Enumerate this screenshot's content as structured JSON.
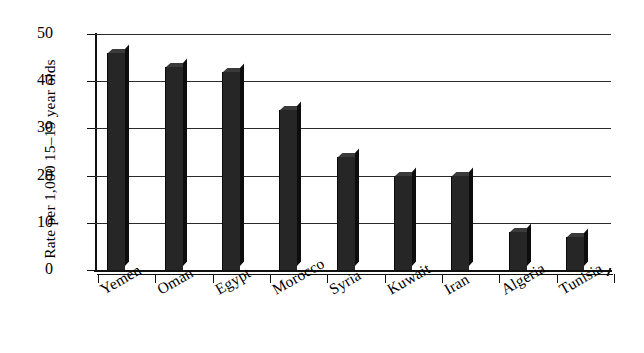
{
  "chart_data": {
    "type": "bar",
    "title": "",
    "xlabel": "",
    "ylabel": "Rate per 1,000 15–19 year olds",
    "categories": [
      "Yemen",
      "Oman",
      "Egypt",
      "Morocco",
      "Syria",
      "Kuwait",
      "Iran",
      "Algeria",
      "Tunisia"
    ],
    "values": [
      46,
      43,
      42,
      34,
      24,
      20,
      20,
      8,
      7
    ],
    "ylim": [
      0,
      50
    ],
    "ytick_labels": [
      "50",
      "40",
      "30",
      "20",
      "10",
      "0"
    ],
    "ytick_values": [
      50,
      40,
      30,
      20,
      10,
      0
    ],
    "grid": "horizontal",
    "legend": "none",
    "bar_color": "#262626",
    "axis_color": "#111111",
    "gridline_color": "#2a2a2a",
    "background_color": "#ffffff"
  }
}
